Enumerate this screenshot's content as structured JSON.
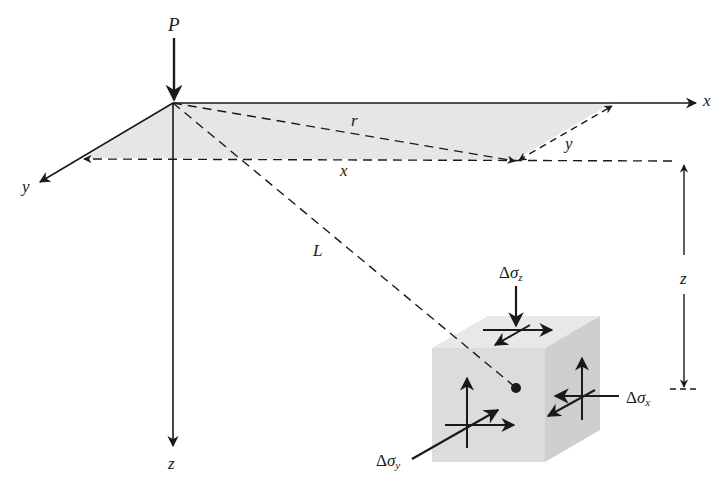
{
  "diagram": {
    "type": "point-load-stress-schematic",
    "labels": {
      "load": "P",
      "x_axis": "x",
      "y_axis": "y",
      "z_axis": "z",
      "radial_distance": "r",
      "x_distance": "x",
      "y_distance": "y",
      "slant_distance": "L",
      "depth": "z",
      "stress_z_delta": "Δ",
      "stress_z_sym": "σ",
      "stress_z_sub": "z",
      "stress_x_delta": "Δ",
      "stress_x_sym": "σ",
      "stress_x_sub": "x",
      "stress_y_delta": "Δ",
      "stress_y_sym": "σ",
      "stress_y_sub": "y"
    },
    "colors": {
      "line": "#1a1a1a",
      "plane_fill": "#e6e6e6",
      "cube_front": "#dcdcdc",
      "cube_top": "#e8e8e8",
      "cube_side": "#cfcfcf"
    }
  }
}
